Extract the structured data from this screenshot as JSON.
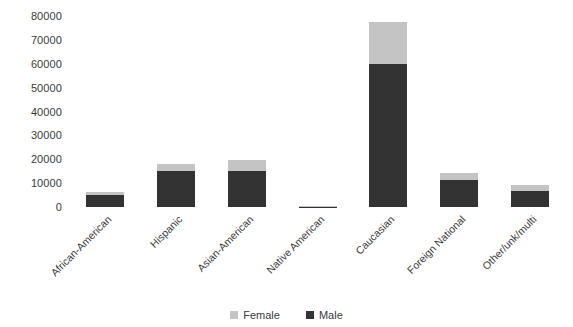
{
  "chart_data": {
    "type": "bar",
    "subtype": "stacked-vertical",
    "title": "",
    "xlabel": "",
    "ylabel": "",
    "ylim": [
      0,
      80000
    ],
    "ytick_labels": [
      "0",
      "10000",
      "20000",
      "30000",
      "40000",
      "50000",
      "60000",
      "70000",
      "80000"
    ],
    "ytick_values": [
      0,
      10000,
      20000,
      30000,
      40000,
      50000,
      60000,
      70000,
      80000
    ],
    "grid": false,
    "legend_position": "bottom-center",
    "categories": [
      "African-American",
      "Hispanic",
      "Asian-American",
      "Native American",
      "Caucasian",
      "Foreign National",
      "Other/unk/multi"
    ],
    "series": [
      {
        "name": "Male",
        "color": "#333333",
        "values": [
          4900,
          15000,
          15000,
          150,
          60000,
          11500,
          6600
        ]
      },
      {
        "name": "Female",
        "color": "#c4c4c4",
        "values": [
          1300,
          3100,
          4500,
          100,
          17500,
          2700,
          2700
        ]
      }
    ],
    "totals": [
      6200,
      18100,
      19500,
      250,
      77500,
      14200,
      9300
    ]
  },
  "legend": {
    "items": [
      {
        "label": "Female",
        "color": "#c4c4c4"
      },
      {
        "label": "Male",
        "color": "#333333"
      }
    ]
  }
}
